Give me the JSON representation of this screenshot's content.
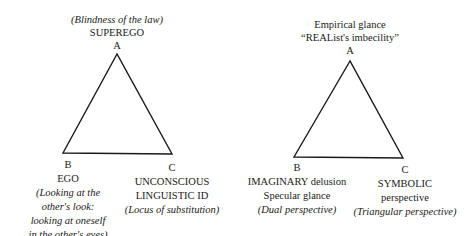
{
  "diagrams": [
    {
      "name": "psychoanalytic-triangle",
      "vertex_a": {
        "letter": "A",
        "annotation": "(Blindness of the law)",
        "title": "SUPEREGO"
      },
      "vertex_b": {
        "letter": "B",
        "title": "EGO",
        "annotation_lines": [
          "(Looking at the",
          "other's look:",
          "looking at oneself",
          "in the other's eyes)"
        ]
      },
      "vertex_c": {
        "letter": "C",
        "title_lines": [
          "UNCONSCIOUS",
          "LINGUISTIC ID"
        ],
        "annotation": "(Locus of substitution)"
      }
    },
    {
      "name": "perspective-triangle",
      "vertex_a": {
        "letter": "A",
        "title_lines": [
          "Empirical glance",
          "“REAList's imbecility”"
        ]
      },
      "vertex_b": {
        "letter": "B",
        "title_lines": [
          "IMAGINARY delusion",
          "Specular glance"
        ],
        "annotation": "(Dual perspective)"
      },
      "vertex_c": {
        "letter": "C",
        "title_lines": [
          "SYMBOLIC",
          "perspective"
        ],
        "annotation": "(Triangular perspective)"
      }
    }
  ]
}
